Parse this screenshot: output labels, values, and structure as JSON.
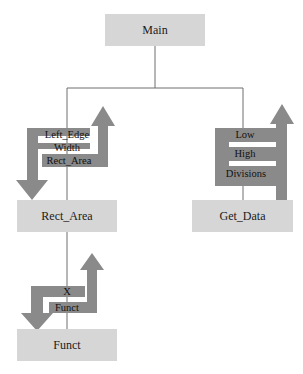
{
  "diagram": {
    "type": "structure-chart",
    "colors": {
      "module_fill": "#d6d6d6",
      "arrow_fill": "#8a8a8a",
      "line": "#6e6e6e",
      "background": "#ffffff"
    },
    "modules": {
      "main": {
        "label": "Main"
      },
      "rect_area": {
        "label": "Rect_Area"
      },
      "get_data": {
        "label": "Get_Data"
      },
      "funct": {
        "label": "Funct"
      }
    },
    "flows": {
      "main_to_rect_area": {
        "params": [
          "Left_Edge",
          "Width",
          "Rect_Area"
        ],
        "down_direction": "into Rect_Area",
        "up_direction": "back to Main"
      },
      "main_to_get_data": {
        "params": [
          "Low",
          "High",
          "Divisions"
        ],
        "up_direction": "back to Main"
      },
      "rect_area_to_funct": {
        "params": [
          "X",
          "Funct"
        ],
        "down_direction": "into Funct",
        "up_direction": "back to Rect_Area"
      }
    }
  }
}
